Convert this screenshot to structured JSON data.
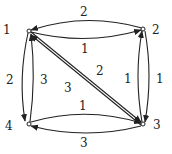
{
  "nodes": [
    {
      "id": "1",
      "label": "1",
      "x": 29,
      "y": 31,
      "lx": 3,
      "ly": 24
    },
    {
      "id": "2",
      "label": "2",
      "x": 143,
      "y": 29,
      "lx": 152,
      "ly": 24
    },
    {
      "id": "3",
      "label": "3",
      "x": 143,
      "y": 124,
      "lx": 153,
      "ly": 119
    },
    {
      "id": "4",
      "label": "4",
      "x": 29,
      "y": 124,
      "lx": 5,
      "ly": 120
    }
  ],
  "edges": [
    {
      "from": "2",
      "to": "1",
      "weight": "2",
      "lx": 80,
      "ly": 6
    },
    {
      "from": "1",
      "to": "2",
      "weight": "1",
      "lx": 81,
      "ly": 43
    },
    {
      "from": "1",
      "to": "3",
      "weight": "2",
      "lx": 96,
      "ly": 65
    },
    {
      "from": "3",
      "to": "1",
      "weight": "3",
      "lx": 64,
      "ly": 82
    },
    {
      "from": "3",
      "to": "2",
      "weight": "1",
      "lx": 124,
      "ly": 73
    },
    {
      "from": "2",
      "to": "3",
      "weight": "1",
      "lx": 156,
      "ly": 73
    },
    {
      "from": "1",
      "to": "4",
      "weight": "2",
      "lx": 6,
      "ly": 74
    },
    {
      "from": "4",
      "to": "1",
      "weight": "3",
      "lx": 40,
      "ly": 74
    },
    {
      "from": "4",
      "to": "3",
      "weight": "1",
      "lx": 79,
      "ly": 100
    },
    {
      "from": "3",
      "to": "4",
      "weight": "3",
      "lx": 80,
      "ly": 137
    }
  ]
}
